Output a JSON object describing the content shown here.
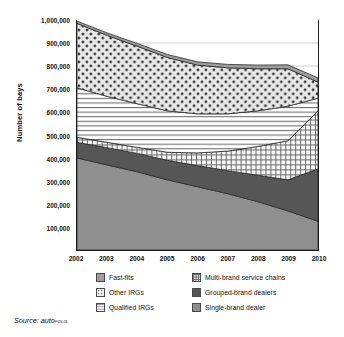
{
  "axis": {
    "ylabel": "Number of bays",
    "yticks": [
      "1,000,000",
      "900,000",
      "800,000",
      "700,000",
      "600,000",
      "500,000",
      "400,000",
      "300,000",
      "200,000",
      "100,000"
    ],
    "xticks": [
      "2002",
      "2003",
      "2004",
      "2005",
      "2006",
      "2007",
      "2008",
      "2009",
      "2010"
    ]
  },
  "legend": {
    "items": [
      {
        "label": "Fast-fits",
        "pattern": "solid-mid-gray",
        "color": "#9d9d9d"
      },
      {
        "label": "Multi-brand service chains",
        "pattern": "crosshatch-grid",
        "color": "#e2e2e2"
      },
      {
        "label": "Other IRGs",
        "pattern": "checkerboard-dots",
        "color": "#f2f2f2"
      },
      {
        "label": "Grouped-brand dealers",
        "pattern": "solid-dark-gray",
        "color": "#565656"
      },
      {
        "label": "Qualified IRGs",
        "pattern": "horizontal-lines",
        "color": "#f7f7f7"
      },
      {
        "label": "Single-brand dealer",
        "pattern": "solid-gray",
        "color": "#8f8f8f"
      }
    ]
  },
  "source": {
    "prefix": "Source: ",
    "brand_lower": "auto",
    "brand_caps": "polis"
  },
  "chart_data": {
    "type": "area",
    "stacked": true,
    "title": "",
    "xlabel": "",
    "ylabel": "Number of bays",
    "x": [
      2002,
      2003,
      2004,
      2005,
      2006,
      2007,
      2008,
      2009,
      2010
    ],
    "ylim": [
      0,
      1000000
    ],
    "ytick_step": 100000,
    "grid": true,
    "legend_position": "bottom",
    "series": [
      {
        "name": "Single-brand dealer",
        "values": [
          400000,
          370000,
          340000,
          305000,
          275000,
          245000,
          210000,
          170000,
          125000
        ]
      },
      {
        "name": "Grouped-brand dealers",
        "values": [
          68000,
          75000,
          80000,
          85000,
          92000,
          100000,
          115000,
          135000,
          228000
        ]
      },
      {
        "name": "Multi-brand service chains",
        "values": [
          22000,
          23000,
          26000,
          35000,
          55000,
          85000,
          125000,
          170000,
          252000
        ]
      },
      {
        "name": "Qualified IRGs",
        "values": [
          215000,
          200000,
          190000,
          180000,
          170000,
          162000,
          155000,
          150000,
          55000
        ]
      },
      {
        "name": "Other IRGs",
        "values": [
          280000,
          265000,
          250000,
          232000,
          212000,
          200000,
          183000,
          163000,
          70000
        ]
      },
      {
        "name": "Fast-fits",
        "values": [
          10000,
          11000,
          12000,
          13000,
          14000,
          15000,
          16000,
          17000,
          18000
        ]
      }
    ],
    "cumulative_tops": {
      "Single-brand dealer": [
        400000,
        370000,
        340000,
        305000,
        275000,
        245000,
        210000,
        170000,
        125000
      ],
      "Grouped-brand dealers": [
        468000,
        445000,
        420000,
        390000,
        367000,
        345000,
        325000,
        305000,
        353000
      ],
      "Multi-brand service chains": [
        490000,
        468000,
        446000,
        425000,
        422000,
        430000,
        450000,
        475000,
        605000
      ],
      "Qualified IRGs": [
        705000,
        668000,
        636000,
        605000,
        592000,
        592000,
        605000,
        625000,
        660000
      ],
      "Other IRGs": [
        985000,
        933000,
        886000,
        837000,
        804000,
        792000,
        788000,
        788000,
        730000
      ]
    }
  }
}
